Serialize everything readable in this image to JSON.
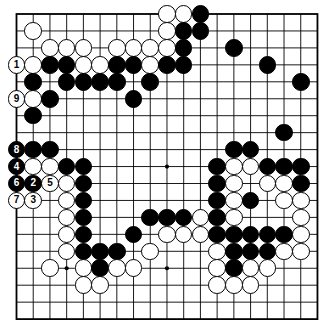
{
  "diagram": {
    "board_size": 19,
    "geometry": {
      "origin_x": 16.5,
      "origin_y": 14.0,
      "spacing_x": 16.72,
      "spacing_y": 16.95,
      "stone_diameter": 17.6
    },
    "colors": {
      "background": "#ffffff",
      "grid_line": "#000000",
      "black_stone": "#000000",
      "white_stone": "#ffffff",
      "stone_outline": "#000000",
      "black_label": "#ffffff",
      "white_label": "#000000"
    },
    "star_points": [
      {
        "col": 3,
        "row": 3
      },
      {
        "col": 9,
        "row": 3
      },
      {
        "col": 15,
        "row": 3
      },
      {
        "col": 3,
        "row": 9
      },
      {
        "col": 9,
        "row": 9
      },
      {
        "col": 15,
        "row": 9
      },
      {
        "col": 3,
        "row": 15
      },
      {
        "col": 9,
        "row": 15
      },
      {
        "col": 15,
        "row": 15
      }
    ],
    "stones": [
      {
        "col": 9,
        "row": 0,
        "color": "white",
        "label": ""
      },
      {
        "col": 10,
        "row": 0,
        "color": "white",
        "label": ""
      },
      {
        "col": 11,
        "row": 0,
        "color": "black",
        "label": ""
      },
      {
        "col": 1,
        "row": 1,
        "color": "white",
        "label": ""
      },
      {
        "col": 9,
        "row": 1,
        "color": "white",
        "label": ""
      },
      {
        "col": 10,
        "row": 1,
        "color": "black",
        "label": ""
      },
      {
        "col": 11,
        "row": 1,
        "color": "black",
        "label": ""
      },
      {
        "col": 2,
        "row": 2,
        "color": "white",
        "label": ""
      },
      {
        "col": 3,
        "row": 2,
        "color": "white",
        "label": ""
      },
      {
        "col": 4,
        "row": 2,
        "color": "white",
        "label": ""
      },
      {
        "col": 6,
        "row": 2,
        "color": "white",
        "label": ""
      },
      {
        "col": 7,
        "row": 2,
        "color": "white",
        "label": ""
      },
      {
        "col": 8,
        "row": 2,
        "color": "white",
        "label": ""
      },
      {
        "col": 9,
        "row": 2,
        "color": "white",
        "label": ""
      },
      {
        "col": 10,
        "row": 2,
        "color": "black",
        "label": ""
      },
      {
        "col": 13,
        "row": 2,
        "color": "black",
        "label": ""
      },
      {
        "col": 0,
        "row": 3,
        "color": "white",
        "label": "1"
      },
      {
        "col": 1,
        "row": 3,
        "color": "white",
        "label": ""
      },
      {
        "col": 2,
        "row": 3,
        "color": "black",
        "label": ""
      },
      {
        "col": 3,
        "row": 3,
        "color": "black",
        "label": ""
      },
      {
        "col": 4,
        "row": 3,
        "color": "white",
        "label": ""
      },
      {
        "col": 5,
        "row": 3,
        "color": "white",
        "label": ""
      },
      {
        "col": 6,
        "row": 3,
        "color": "black",
        "label": ""
      },
      {
        "col": 7,
        "row": 3,
        "color": "black",
        "label": ""
      },
      {
        "col": 8,
        "row": 3,
        "color": "white",
        "label": ""
      },
      {
        "col": 9,
        "row": 3,
        "color": "black",
        "label": ""
      },
      {
        "col": 10,
        "row": 3,
        "color": "black",
        "label": ""
      },
      {
        "col": 15,
        "row": 3,
        "color": "black",
        "label": ""
      },
      {
        "col": 1,
        "row": 4,
        "color": "black",
        "label": ""
      },
      {
        "col": 3,
        "row": 4,
        "color": "black",
        "label": ""
      },
      {
        "col": 4,
        "row": 4,
        "color": "black",
        "label": ""
      },
      {
        "col": 5,
        "row": 4,
        "color": "black",
        "label": ""
      },
      {
        "col": 6,
        "row": 4,
        "color": "black",
        "label": ""
      },
      {
        "col": 8,
        "row": 4,
        "color": "black",
        "label": ""
      },
      {
        "col": 17,
        "row": 4,
        "color": "black",
        "label": ""
      },
      {
        "col": 0,
        "row": 5,
        "color": "white",
        "label": "9"
      },
      {
        "col": 1,
        "row": 5,
        "color": "white",
        "label": ""
      },
      {
        "col": 2,
        "row": 5,
        "color": "black",
        "label": ""
      },
      {
        "col": 7,
        "row": 5,
        "color": "black",
        "label": ""
      },
      {
        "col": 1,
        "row": 6,
        "color": "black",
        "label": ""
      },
      {
        "col": 16,
        "row": 7,
        "color": "black",
        "label": ""
      },
      {
        "col": 0,
        "row": 8,
        "color": "black",
        "label": "8"
      },
      {
        "col": 1,
        "row": 8,
        "color": "black",
        "label": ""
      },
      {
        "col": 2,
        "row": 8,
        "color": "black",
        "label": ""
      },
      {
        "col": 13,
        "row": 8,
        "color": "black",
        "label": ""
      },
      {
        "col": 14,
        "row": 8,
        "color": "black",
        "label": ""
      },
      {
        "col": 0,
        "row": 9,
        "color": "black",
        "label": "4"
      },
      {
        "col": 1,
        "row": 9,
        "color": "white",
        "label": ""
      },
      {
        "col": 2,
        "row": 9,
        "color": "white",
        "label": ""
      },
      {
        "col": 3,
        "row": 9,
        "color": "black",
        "label": ""
      },
      {
        "col": 4,
        "row": 9,
        "color": "black",
        "label": ""
      },
      {
        "col": 12,
        "row": 9,
        "color": "black",
        "label": ""
      },
      {
        "col": 13,
        "row": 9,
        "color": "white",
        "label": ""
      },
      {
        "col": 14,
        "row": 9,
        "color": "white",
        "label": ""
      },
      {
        "col": 15,
        "row": 9,
        "color": "black",
        "label": ""
      },
      {
        "col": 16,
        "row": 9,
        "color": "black",
        "label": ""
      },
      {
        "col": 17,
        "row": 9,
        "color": "black",
        "label": ""
      },
      {
        "col": 0,
        "row": 10,
        "color": "black",
        "label": "6"
      },
      {
        "col": 1,
        "row": 10,
        "color": "black",
        "label": "2"
      },
      {
        "col": 2,
        "row": 10,
        "color": "white",
        "label": "5"
      },
      {
        "col": 3,
        "row": 10,
        "color": "white",
        "label": ""
      },
      {
        "col": 4,
        "row": 10,
        "color": "black",
        "label": ""
      },
      {
        "col": 12,
        "row": 10,
        "color": "black",
        "label": ""
      },
      {
        "col": 13,
        "row": 10,
        "color": "white",
        "label": ""
      },
      {
        "col": 15,
        "row": 10,
        "color": "white",
        "label": ""
      },
      {
        "col": 16,
        "row": 10,
        "color": "white",
        "label": ""
      },
      {
        "col": 17,
        "row": 10,
        "color": "black",
        "label": ""
      },
      {
        "col": 0,
        "row": 11,
        "color": "white",
        "label": "7"
      },
      {
        "col": 1,
        "row": 11,
        "color": "white",
        "label": "3"
      },
      {
        "col": 3,
        "row": 11,
        "color": "white",
        "label": ""
      },
      {
        "col": 4,
        "row": 11,
        "color": "black",
        "label": ""
      },
      {
        "col": 12,
        "row": 11,
        "color": "black",
        "label": ""
      },
      {
        "col": 13,
        "row": 11,
        "color": "white",
        "label": ""
      },
      {
        "col": 14,
        "row": 11,
        "color": "black",
        "label": ""
      },
      {
        "col": 16,
        "row": 11,
        "color": "white",
        "label": ""
      },
      {
        "col": 17,
        "row": 11,
        "color": "white",
        "label": ""
      },
      {
        "col": 3,
        "row": 12,
        "color": "white",
        "label": ""
      },
      {
        "col": 4,
        "row": 12,
        "color": "black",
        "label": ""
      },
      {
        "col": 8,
        "row": 12,
        "color": "black",
        "label": ""
      },
      {
        "col": 9,
        "row": 12,
        "color": "black",
        "label": ""
      },
      {
        "col": 10,
        "row": 12,
        "color": "black",
        "label": ""
      },
      {
        "col": 11,
        "row": 12,
        "color": "white",
        "label": ""
      },
      {
        "col": 12,
        "row": 12,
        "color": "black",
        "label": ""
      },
      {
        "col": 13,
        "row": 12,
        "color": "white",
        "label": ""
      },
      {
        "col": 17,
        "row": 12,
        "color": "white",
        "label": ""
      },
      {
        "col": 3,
        "row": 13,
        "color": "white",
        "label": ""
      },
      {
        "col": 4,
        "row": 13,
        "color": "black",
        "label": ""
      },
      {
        "col": 7,
        "row": 13,
        "color": "black",
        "label": ""
      },
      {
        "col": 9,
        "row": 13,
        "color": "white",
        "label": ""
      },
      {
        "col": 10,
        "row": 13,
        "color": "white",
        "label": ""
      },
      {
        "col": 11,
        "row": 13,
        "color": "white",
        "label": ""
      },
      {
        "col": 12,
        "row": 13,
        "color": "black",
        "label": ""
      },
      {
        "col": 13,
        "row": 13,
        "color": "black",
        "label": ""
      },
      {
        "col": 14,
        "row": 13,
        "color": "black",
        "label": ""
      },
      {
        "col": 15,
        "row": 13,
        "color": "black",
        "label": ""
      },
      {
        "col": 16,
        "row": 13,
        "color": "black",
        "label": ""
      },
      {
        "col": 17,
        "row": 13,
        "color": "white",
        "label": ""
      },
      {
        "col": 3,
        "row": 14,
        "color": "white",
        "label": ""
      },
      {
        "col": 4,
        "row": 14,
        "color": "black",
        "label": ""
      },
      {
        "col": 5,
        "row": 14,
        "color": "black",
        "label": ""
      },
      {
        "col": 6,
        "row": 14,
        "color": "black",
        "label": ""
      },
      {
        "col": 8,
        "row": 14,
        "color": "white",
        "label": ""
      },
      {
        "col": 12,
        "row": 14,
        "color": "white",
        "label": ""
      },
      {
        "col": 13,
        "row": 14,
        "color": "black",
        "label": ""
      },
      {
        "col": 14,
        "row": 14,
        "color": "black",
        "label": ""
      },
      {
        "col": 15,
        "row": 14,
        "color": "black",
        "label": ""
      },
      {
        "col": 16,
        "row": 14,
        "color": "white",
        "label": ""
      },
      {
        "col": 17,
        "row": 14,
        "color": "white",
        "label": ""
      },
      {
        "col": 2,
        "row": 15,
        "color": "white",
        "label": ""
      },
      {
        "col": 4,
        "row": 15,
        "color": "white",
        "label": ""
      },
      {
        "col": 5,
        "row": 15,
        "color": "black",
        "label": ""
      },
      {
        "col": 6,
        "row": 15,
        "color": "white",
        "label": ""
      },
      {
        "col": 7,
        "row": 15,
        "color": "white",
        "label": ""
      },
      {
        "col": 12,
        "row": 15,
        "color": "white",
        "label": ""
      },
      {
        "col": 13,
        "row": 15,
        "color": "black",
        "label": ""
      },
      {
        "col": 14,
        "row": 15,
        "color": "white",
        "label": ""
      },
      {
        "col": 15,
        "row": 15,
        "color": "white",
        "label": ""
      },
      {
        "col": 4,
        "row": 16,
        "color": "white",
        "label": ""
      },
      {
        "col": 5,
        "row": 16,
        "color": "white",
        "label": ""
      },
      {
        "col": 12,
        "row": 16,
        "color": "white",
        "label": ""
      },
      {
        "col": 13,
        "row": 16,
        "color": "white",
        "label": ""
      },
      {
        "col": 14,
        "row": 16,
        "color": "white",
        "label": ""
      }
    ]
  }
}
